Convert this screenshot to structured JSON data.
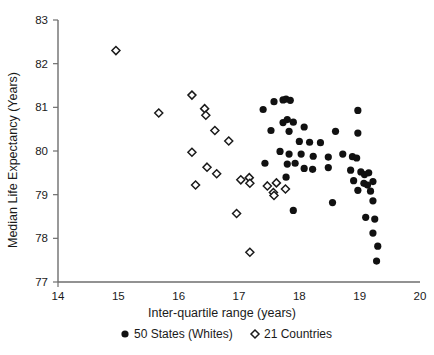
{
  "chart_data": {
    "type": "scatter",
    "title": "",
    "xlabel": "Inter-quartile range (years)",
    "ylabel": "Median Life Expectancy (Years)",
    "xlim": [
      14,
      20
    ],
    "ylim": [
      77,
      83
    ],
    "xticks": [
      14,
      15,
      16,
      17,
      18,
      19,
      20
    ],
    "xtick_labels": [
      "14",
      "15",
      "16",
      "17",
      "18",
      "19",
      "20"
    ],
    "yticks": [
      77,
      78,
      79,
      80,
      81,
      82,
      83
    ],
    "ytick_labels": [
      "77",
      "78",
      "79",
      "80",
      "81",
      "82",
      "83"
    ],
    "grid": false,
    "legend_position": "below",
    "marker_colors": {
      "states": "#111111",
      "countries_stroke": "#1a1a1a",
      "countries_fill": "#ffffff"
    },
    "axis_color": "#6e6e6e",
    "series": [
      {
        "name": "50 States (Whites)",
        "marker": "filled-circle",
        "points": [
          [
            17.58,
            81.13
          ],
          [
            17.73,
            81.17
          ],
          [
            17.78,
            81.19
          ],
          [
            17.85,
            81.16
          ],
          [
            18.97,
            80.93
          ],
          [
            17.4,
            80.95
          ],
          [
            17.73,
            80.65
          ],
          [
            17.8,
            80.72
          ],
          [
            17.9,
            80.66
          ],
          [
            17.53,
            80.47
          ],
          [
            17.83,
            80.45
          ],
          [
            18.08,
            80.55
          ],
          [
            18.6,
            80.45
          ],
          [
            18.97,
            80.41
          ],
          [
            18.0,
            80.22
          ],
          [
            18.17,
            80.2
          ],
          [
            18.35,
            80.19
          ],
          [
            17.68,
            79.99
          ],
          [
            17.83,
            79.93
          ],
          [
            18.03,
            79.93
          ],
          [
            18.23,
            79.88
          ],
          [
            18.48,
            79.86
          ],
          [
            18.72,
            79.93
          ],
          [
            18.88,
            79.87
          ],
          [
            18.95,
            79.84
          ],
          [
            17.43,
            79.72
          ],
          [
            17.8,
            79.7
          ],
          [
            17.93,
            79.72
          ],
          [
            18.08,
            79.6
          ],
          [
            18.22,
            79.58
          ],
          [
            18.48,
            79.62
          ],
          [
            18.85,
            79.56
          ],
          [
            19.02,
            79.52
          ],
          [
            19.08,
            79.46
          ],
          [
            19.15,
            79.5
          ],
          [
            17.78,
            79.4
          ],
          [
            18.9,
            79.32
          ],
          [
            19.07,
            79.26
          ],
          [
            19.13,
            79.22
          ],
          [
            19.22,
            79.3
          ],
          [
            18.97,
            79.1
          ],
          [
            19.18,
            79.08
          ],
          [
            18.55,
            78.82
          ],
          [
            19.22,
            78.86
          ],
          [
            17.9,
            78.64
          ],
          [
            19.1,
            78.48
          ],
          [
            19.25,
            78.44
          ],
          [
            19.22,
            78.12
          ],
          [
            19.3,
            77.82
          ],
          [
            19.28,
            77.48
          ]
        ]
      },
      {
        "name": "21 Countries",
        "marker": "open-diamond",
        "points": [
          [
            14.96,
            82.3
          ],
          [
            16.22,
            81.28
          ],
          [
            15.67,
            80.87
          ],
          [
            16.43,
            80.97
          ],
          [
            16.45,
            80.82
          ],
          [
            16.6,
            80.47
          ],
          [
            16.83,
            80.23
          ],
          [
            16.22,
            79.97
          ],
          [
            16.47,
            79.63
          ],
          [
            16.63,
            79.48
          ],
          [
            16.28,
            79.22
          ],
          [
            17.03,
            79.34
          ],
          [
            17.17,
            79.39
          ],
          [
            17.18,
            79.26
          ],
          [
            17.47,
            79.2
          ],
          [
            17.62,
            79.27
          ],
          [
            17.57,
            79.05
          ],
          [
            17.58,
            78.98
          ],
          [
            17.77,
            79.13
          ],
          [
            16.96,
            78.57
          ],
          [
            17.18,
            77.68
          ]
        ]
      }
    ]
  },
  "legend": {
    "items": [
      {
        "label": "50 States (Whites)",
        "marker": "filled-circle"
      },
      {
        "label": "21 Countries",
        "marker": "open-diamond"
      }
    ]
  }
}
